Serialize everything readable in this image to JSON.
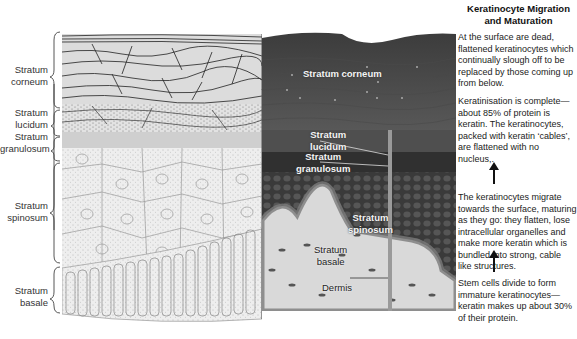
{
  "sidebar": {
    "title": "Keratinocyte Migration and Maturation",
    "paragraphs": [
      "At the surface are dead, flattened keratinocytes which continually slough off to be replaced by those coming up from below.",
      "Keratinisation is complete—about 85% of protein is keratin. The keratinocytes, packed with keratin ‘cables’, are flattened with no nucleus,.",
      "The keratinocytes migrate towards the surface, maturing as they go: they flatten, lose intracellular organelles and make more keratin which is bundled into strong, cable like structures.",
      "Stem cells divide to form immature keratinocytes—keratin makes up about 30% of their protein."
    ]
  },
  "drawing_labels": [
    {
      "line1": "Stratum",
      "line2": "corneum"
    },
    {
      "line1": "Stratum",
      "line2": "lucidum"
    },
    {
      "line1": "Stratum",
      "line2": "granulosum"
    },
    {
      "line1": "Stratum",
      "line2": "spinosum"
    },
    {
      "line1": "Stratum",
      "line2": "basale"
    }
  ],
  "photo_labels": {
    "corneum": "Stratum corneum",
    "lucidum_1": "Stratum",
    "lucidum_2": "lucidum",
    "granulosum_1": "Stratum",
    "granulosum_2": "granulosum",
    "spinosum_1": "Stratum",
    "spinosum_2": "spinosum",
    "basale_1": "Stratum",
    "basale_2": "basale",
    "dermis": "Dermis"
  },
  "colors": {
    "photo_dark": "#4a4a4a",
    "photo_mid": "#6a6a6a",
    "dermis": "#d8d8d8",
    "drawing_fill": "#e6e6e6"
  }
}
